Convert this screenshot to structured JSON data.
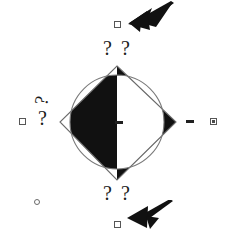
{
  "figure": {
    "background_color": "#ffffff",
    "stroke_color": "#5a5a5a",
    "fill_color": "#111111",
    "width": 227,
    "height": 236
  },
  "shapes": {
    "diamond": {
      "name": "diamond",
      "vertices": [
        [
          117,
          66
        ],
        [
          176,
          122
        ],
        [
          117,
          180
        ],
        [
          60,
          122
        ]
      ],
      "stroke": "#6b6b6b",
      "fill": "none"
    },
    "circle": {
      "name": "inscribed-circle",
      "cx": 117,
      "cy": 122,
      "r": 47,
      "stroke": "#7a7a7a",
      "fill": "none"
    },
    "crescent": {
      "name": "black-crescent",
      "fill": "#111111",
      "description": "filled lens region between circle right arc and diamond right vertex"
    }
  },
  "annotations": {
    "question_marks": {
      "top_left": "?",
      "top_right": "?",
      "bottom_left": "?",
      "bottom_right": "?",
      "left_upper": "?",
      "left_lower": "?"
    },
    "dashes": {
      "center": "–",
      "right": "–"
    }
  },
  "markers": {
    "top_square": "square-marker",
    "left_square": "square-marker",
    "right_square": "square-marker-filled",
    "bottom_square": "square-marker",
    "bottom_left_circle": "circle-marker"
  },
  "arrows": {
    "top_right": {
      "name": "arrow-pointing-down-left",
      "direction": "down-left",
      "color": "#111111"
    },
    "bottom_right": {
      "name": "arrow-pointing-up-left",
      "direction": "up-left",
      "color": "#111111"
    }
  }
}
